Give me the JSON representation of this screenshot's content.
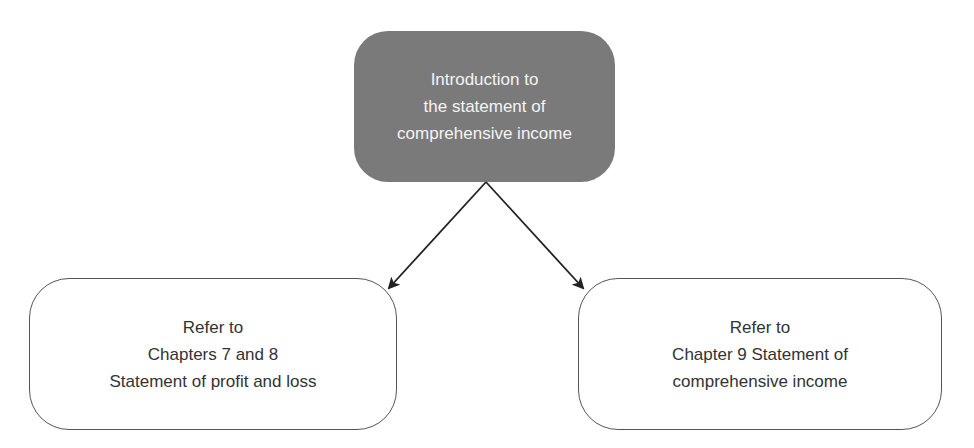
{
  "diagram": {
    "type": "flowchart",
    "nodes": {
      "root": {
        "lines": [
          "Introduction to",
          "the statement of",
          "comprehensive income"
        ],
        "fill": "#7a7a7a",
        "text_color": "#f4f4f4"
      },
      "left": {
        "lines": [
          "Refer to",
          "Chapters 7 and 8",
          "Statement of profit and loss"
        ],
        "fill": "#ffffff",
        "text_color": "#333333"
      },
      "right": {
        "lines": [
          "Refer to",
          "Chapter 9 Statement of",
          "comprehensive income"
        ],
        "fill": "#ffffff",
        "text_color": "#333333"
      }
    },
    "edges": [
      {
        "from": "root",
        "to": "left"
      },
      {
        "from": "root",
        "to": "right"
      }
    ]
  }
}
